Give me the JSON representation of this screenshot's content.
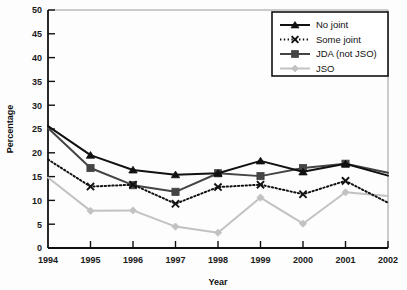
{
  "chart_data": {
    "type": "line",
    "title": "",
    "xlabel": "Year",
    "ylabel": "Percentage",
    "categories": [
      "1994",
      "1995",
      "1996",
      "1997",
      "1998",
      "1999",
      "2000",
      "2001",
      "2002"
    ],
    "x": [
      1994,
      1995,
      1996,
      1997,
      1998,
      1999,
      2000,
      2001,
      2002
    ],
    "xlim": [
      1994,
      2002
    ],
    "ylim": [
      0,
      50
    ],
    "yticks": [
      0,
      5,
      10,
      15,
      20,
      25,
      30,
      35,
      40,
      45,
      50
    ],
    "ytick_labels": [
      "0",
      "5",
      "10",
      "15",
      "20",
      "25",
      "30",
      "35",
      "40",
      "45",
      "50"
    ],
    "grid": false,
    "legend_position": "top-right",
    "series": [
      {
        "name": "No joint",
        "marker": "triangle",
        "line_style": "solid",
        "color": "#111111",
        "values": [
          25.6,
          19.5,
          16.4,
          15.4,
          15.7,
          18.3,
          16.0,
          17.7,
          15.2
        ]
      },
      {
        "name": "Some joint",
        "marker": "x",
        "line_style": "dotted",
        "color": "#111111",
        "values": [
          18.6,
          12.9,
          13.3,
          9.3,
          12.8,
          13.3,
          11.3,
          14.1,
          9.5
        ]
      },
      {
        "name": "JDA (not JSO)",
        "marker": "square",
        "line_style": "solid",
        "color": "#444444",
        "values": [
          25.2,
          16.8,
          13.2,
          11.8,
          15.7,
          15.1,
          16.8,
          17.7,
          15.8
        ]
      },
      {
        "name": "JSO",
        "marker": "diamond",
        "line_style": "solid",
        "color": "#c2c2c2",
        "values": [
          14.8,
          7.8,
          7.9,
          4.5,
          3.2,
          10.6,
          5.1,
          11.7,
          10.9
        ]
      }
    ]
  },
  "legend": {
    "entries": [
      {
        "label": "No joint"
      },
      {
        "label": "Some joint"
      },
      {
        "label": "JDA (not JSO)"
      },
      {
        "label": "JSO"
      }
    ]
  },
  "colors": {
    "no_joint": "#111111",
    "some_joint": "#111111",
    "jda": "#444444",
    "jso": "#c2c2c2",
    "axis": "#111111",
    "frame": "#9a9a9a"
  }
}
